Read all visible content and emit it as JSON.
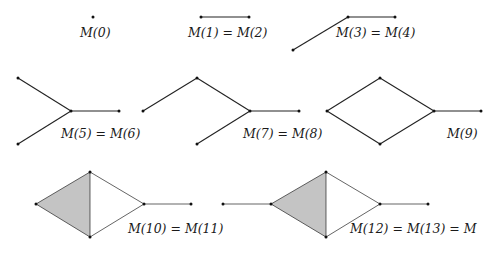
{
  "figure": {
    "colors": {
      "edge": "#222222",
      "fill": "#c4c4c4",
      "vertex": "#111111",
      "background": "#ffffff"
    },
    "panels": [
      {
        "id": "m0",
        "label": "M(0)",
        "label_pos": [
          80,
          26
        ],
        "vertices": [
          [
            93,
            17
          ]
        ],
        "edges": [],
        "filled": []
      },
      {
        "id": "m1",
        "label": "M(1) = M(2)",
        "label_pos": [
          188,
          26
        ],
        "vertices": [
          [
            201,
            17
          ],
          [
            249,
            17
          ]
        ],
        "edges": [
          [
            0,
            1
          ]
        ],
        "filled": []
      },
      {
        "id": "m3",
        "label": "M(3) = M(4)",
        "label_pos": [
          336,
          26
        ],
        "vertices": [
          [
            293,
            50
          ],
          [
            348,
            17
          ],
          [
            395,
            17
          ]
        ],
        "edges": [
          [
            0,
            1
          ],
          [
            1,
            2
          ]
        ],
        "filled": []
      },
      {
        "id": "m5",
        "label": "M(5) = M(6)",
        "label_pos": [
          61,
          127
        ],
        "vertices": [
          [
            18,
            78
          ],
          [
            71,
            111
          ],
          [
            18,
            144
          ],
          [
            119,
            111
          ]
        ],
        "edges": [
          [
            0,
            1
          ],
          [
            2,
            1
          ],
          [
            1,
            3
          ]
        ],
        "filled": []
      },
      {
        "id": "m7",
        "label": "M(7) = M(8)",
        "label_pos": [
          243,
          127
        ],
        "vertices": [
          [
            143,
            111
          ],
          [
            197,
            78
          ],
          [
            250,
            111
          ],
          [
            197,
            144
          ],
          [
            299,
            111
          ]
        ],
        "edges": [
          [
            0,
            1
          ],
          [
            1,
            2
          ],
          [
            3,
            2
          ],
          [
            2,
            4
          ]
        ],
        "filled": []
      },
      {
        "id": "m9",
        "label": "M(9)",
        "label_pos": [
          447,
          127
        ],
        "vertices": [
          [
            327,
            111
          ],
          [
            380,
            78
          ],
          [
            434,
            111
          ],
          [
            380,
            144
          ],
          [
            481,
            111
          ]
        ],
        "edges": [
          [
            0,
            1
          ],
          [
            1,
            2
          ],
          [
            0,
            3
          ],
          [
            3,
            2
          ],
          [
            2,
            4
          ]
        ],
        "filled": []
      },
      {
        "id": "m10",
        "label": "M(10) = M(11)",
        "label_pos": [
          128,
          222
        ],
        "vertices": [
          [
            36,
            204
          ],
          [
            90,
            172
          ],
          [
            144,
            204
          ],
          [
            90,
            237
          ],
          [
            191,
            204
          ]
        ],
        "edges": [
          [
            0,
            1
          ],
          [
            1,
            2
          ],
          [
            0,
            3
          ],
          [
            3,
            2
          ],
          [
            2,
            4
          ],
          [
            1,
            3
          ]
        ],
        "filled": [
          [
            0,
            1,
            3
          ]
        ]
      },
      {
        "id": "m12",
        "label": "M(12) = M(13) = M",
        "label_pos": [
          350,
          222
        ],
        "vertices": [
          [
            223,
            204
          ],
          [
            271,
            204
          ],
          [
            326,
            172
          ],
          [
            380,
            204
          ],
          [
            326,
            237
          ],
          [
            428,
            204
          ]
        ],
        "edges": [
          [
            0,
            1
          ],
          [
            1,
            2
          ],
          [
            2,
            3
          ],
          [
            1,
            4
          ],
          [
            4,
            3
          ],
          [
            3,
            5
          ],
          [
            2,
            4
          ]
        ],
        "filled": [
          [
            1,
            2,
            4
          ]
        ]
      }
    ]
  }
}
